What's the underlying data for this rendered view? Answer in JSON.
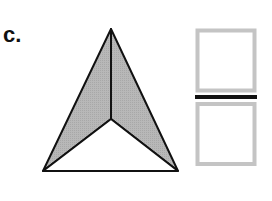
{
  "figure": {
    "label": "c.",
    "pyramid": {
      "apex": [
        111,
        29
      ],
      "bottom_left": [
        43,
        171
      ],
      "bottom_right": [
        178,
        171
      ],
      "inner_vertex": [
        111,
        119
      ],
      "shaded_fill": "#b4b4b4",
      "unshaded_fill": "#ffffff",
      "stroke": "#111111"
    },
    "squares": {
      "stroke": "#c4c4c4",
      "fill": "#ffffff",
      "separator_color": "#111111"
    }
  }
}
